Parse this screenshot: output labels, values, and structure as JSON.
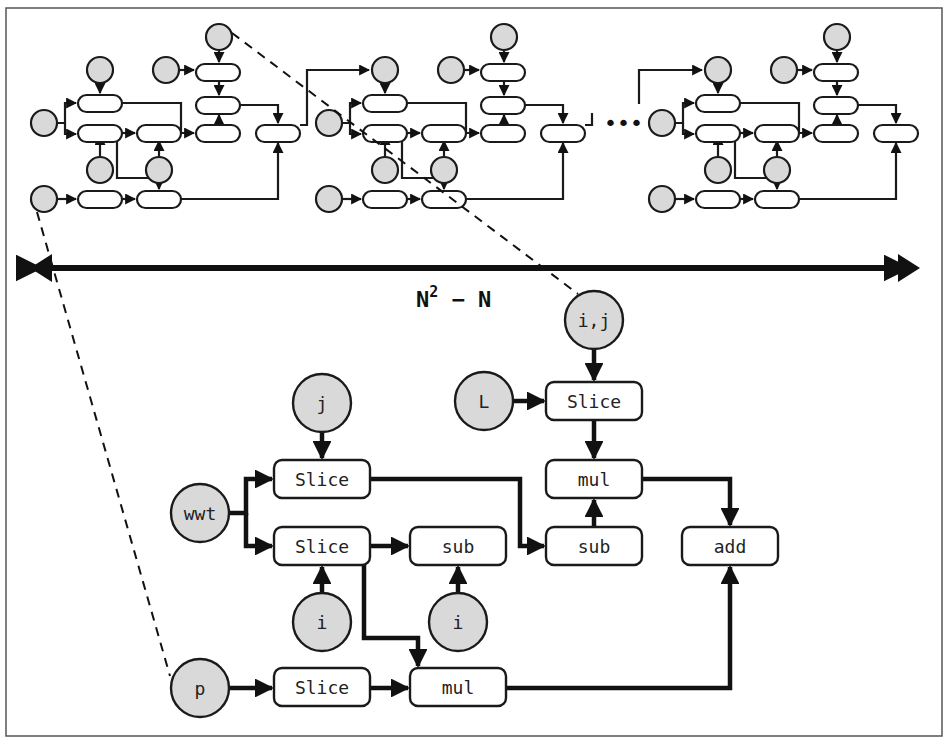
{
  "figure": {
    "span_label": {
      "base": "N",
      "sup": "2",
      "rest": " − N"
    },
    "ellipsis": "•••",
    "colors": {
      "variable_fill": "#d9d9d9",
      "op_fill": "#ffffff",
      "stroke": "#1a1a1a"
    }
  },
  "mini_graphs": {
    "offsets_x": [
      0,
      285,
      618
    ],
    "ops": [
      {
        "x": 78,
        "y": 95
      },
      {
        "x": 78,
        "y": 125
      },
      {
        "x": 137,
        "y": 125
      },
      {
        "x": 196,
        "y": 64
      },
      {
        "x": 196,
        "y": 97
      },
      {
        "x": 196,
        "y": 125
      },
      {
        "x": 256,
        "y": 125
      },
      {
        "x": 78,
        "y": 191
      },
      {
        "x": 137,
        "y": 191
      }
    ],
    "vars": [
      {
        "cx": 44,
        "cy": 123
      },
      {
        "cx": 100,
        "cy": 70
      },
      {
        "cx": 100,
        "cy": 170
      },
      {
        "cx": 159,
        "cy": 170
      },
      {
        "cx": 166,
        "cy": 70
      },
      {
        "cx": 219,
        "cy": 37
      },
      {
        "cx": 44,
        "cy": 199
      }
    ],
    "edges": [
      "M 58 123 H 65 V 103 H 76",
      "M 65 123 V 134 H 76",
      "M 100 84 V 93",
      "M 100 156 V 135",
      "M 122 133 H 135",
      "M 159 156 V 141",
      "M 122 103 H 181 V 133 H 194",
      "M 117 141 V 178 H 159 V 189",
      "M 180 70 H 194",
      "M 219 51 V 62",
      "M 219 80 V 95",
      "M 219 133 V 115",
      "M 240 105 H 278 V 123",
      "M 58 199 H 76",
      "M 122 199 H 135",
      "M 181 199 H 278 V 143"
    ]
  },
  "nodes": {
    "ops": [
      {
        "id": "slice_top",
        "label": "Slice",
        "x": 546,
        "y": 382,
        "w": 96,
        "h": 38
      },
      {
        "id": "mul_right",
        "label": "mul",
        "x": 546,
        "y": 460,
        "w": 96,
        "h": 38
      },
      {
        "id": "slice_j",
        "label": "Slice",
        "x": 274,
        "y": 460,
        "w": 96,
        "h": 38
      },
      {
        "id": "slice_i",
        "label": "Slice",
        "x": 274,
        "y": 527,
        "w": 96,
        "h": 38
      },
      {
        "id": "sub_mid",
        "label": "sub",
        "x": 410,
        "y": 527,
        "w": 96,
        "h": 38
      },
      {
        "id": "sub_right",
        "label": "sub",
        "x": 546,
        "y": 527,
        "w": 96,
        "h": 38
      },
      {
        "id": "add",
        "label": "add",
        "x": 682,
        "y": 527,
        "w": 96,
        "h": 38
      },
      {
        "id": "slice_p",
        "label": "Slice",
        "x": 274,
        "y": 668,
        "w": 96,
        "h": 38
      },
      {
        "id": "mul_bottom",
        "label": "mul",
        "x": 410,
        "y": 668,
        "w": 96,
        "h": 38
      }
    ],
    "vars": [
      {
        "id": "var_ij",
        "label": "i,j",
        "cx": 594,
        "cy": 320,
        "r": 29
      },
      {
        "id": "var_L",
        "label": "L",
        "cx": 484,
        "cy": 401,
        "r": 29
      },
      {
        "id": "var_j",
        "label": "j",
        "cx": 322,
        "cy": 403,
        "r": 29
      },
      {
        "id": "var_wwt",
        "label": "wwt",
        "cx": 200,
        "cy": 513,
        "r": 29
      },
      {
        "id": "var_i1",
        "label": "i",
        "cx": 322,
        "cy": 622,
        "r": 29
      },
      {
        "id": "var_i2",
        "label": "i",
        "cx": 458,
        "cy": 622,
        "r": 29
      },
      {
        "id": "var_p",
        "label": "p",
        "cx": 200,
        "cy": 688,
        "r": 29
      }
    ],
    "edges": [
      "M 594 349 V 380",
      "M 513 401 H 544",
      "M 594 420 V 458",
      "M 351 403 M 322 432 V 458",
      "M 229 513 H 246 V 479 H 272",
      "M 246 513 V 546 H 272",
      "M 370 479 H 520 V 546 H 544",
      "M 370 546 H 408",
      "M 594 527 V 500",
      "M 642 479 H 730 V 525",
      "M 322 593 V 567",
      "M 458 593 V 567",
      "M 364 565 V 638 H 418 V 666",
      "M 229 688 H 272",
      "M 370 688 H 408",
      "M 506 688 H 730 V 567"
    ]
  }
}
